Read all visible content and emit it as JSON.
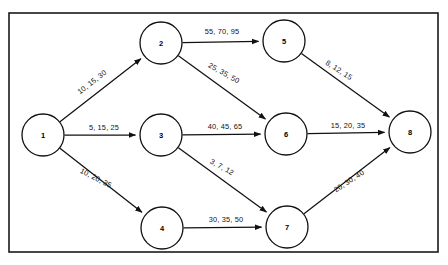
{
  "diagram": {
    "type": "directed-graph",
    "border_color": "#1a1a1a",
    "node_color": "#111111",
    "edge_color": "#111111",
    "frame": {
      "x": 9,
      "y": 13,
      "width": 429,
      "height": 239
    },
    "nodes": [
      {
        "id": "1",
        "label": "1",
        "cx": 43,
        "cy": 135,
        "r": 21
      },
      {
        "id": "2",
        "label": "2",
        "cx": 161,
        "cy": 43,
        "r": 21
      },
      {
        "id": "3",
        "label": "3",
        "cx": 161,
        "cy": 135,
        "r": 21
      },
      {
        "id": "4",
        "label": "4",
        "cx": 162,
        "cy": 228,
        "r": 21
      },
      {
        "id": "5",
        "label": "5",
        "cx": 284,
        "cy": 41,
        "r": 21
      },
      {
        "id": "6",
        "label": "6",
        "cx": 286,
        "cy": 134,
        "r": 21
      },
      {
        "id": "7",
        "label": "7",
        "cx": 287,
        "cy": 227,
        "r": 21
      },
      {
        "id": "8",
        "label": "8",
        "cx": 410,
        "cy": 132,
        "r": 21
      }
    ],
    "edges": [
      {
        "from": "1",
        "to": "2",
        "label": "10, 15, 30",
        "label_x": 92,
        "label_y": 82,
        "rotate": -38
      },
      {
        "from": "1",
        "to": "3",
        "label": "5, 15, 25",
        "label_x": 104,
        "label_y": 127,
        "rotate": 0
      },
      {
        "from": "1",
        "to": "4",
        "label": "10, 20, 35",
        "label_x": 96,
        "label_y": 178,
        "rotate": 27
      },
      {
        "from": "2",
        "to": "5",
        "label": "55, 70, 95",
        "label_x": 222,
        "label_y": 31,
        "rotate": 0
      },
      {
        "from": "2",
        "to": "6",
        "label": "25, 35, 50",
        "label_x": 224,
        "label_y": 73,
        "rotate": 29
      },
      {
        "from": "3",
        "to": "6",
        "label": "40, 45, 65",
        "label_x": 225,
        "label_y": 126,
        "rotate": 0
      },
      {
        "from": "3",
        "to": "7",
        "label": "3, 7, 12",
        "label_x": 222,
        "label_y": 167,
        "rotate": 29
      },
      {
        "from": "4",
        "to": "7",
        "label": "30, 35, 50",
        "label_x": 226,
        "label_y": 219,
        "rotate": 0
      },
      {
        "from": "5",
        "to": "8",
        "label": "8, 12, 15",
        "label_x": 339,
        "label_y": 70,
        "rotate": 33
      },
      {
        "from": "6",
        "to": "8",
        "label": "15, 20, 35",
        "label_x": 348,
        "label_y": 125,
        "rotate": 0
      },
      {
        "from": "7",
        "to": "8",
        "label": "20, 30, 40",
        "label_x": 349,
        "label_y": 181,
        "rotate": -33
      }
    ]
  }
}
